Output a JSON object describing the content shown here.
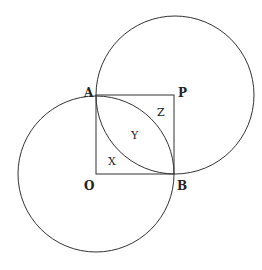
{
  "diagram": {
    "stroke_color": "#333333",
    "background": "#ffffff",
    "points": {
      "A": {
        "label": "A",
        "x": 96,
        "y": 95
      },
      "P": {
        "label": "P",
        "x": 174,
        "y": 95
      },
      "O": {
        "label": "O",
        "x": 96,
        "y": 174
      },
      "B": {
        "label": "B",
        "x": 174,
        "y": 174
      }
    },
    "circles": [
      {
        "center": "P",
        "radius": 79
      },
      {
        "center": "O",
        "radius": 78
      }
    ],
    "square": [
      "A",
      "P",
      "B",
      "O"
    ],
    "regions": {
      "X": "X",
      "Y": "Y",
      "Z": "Z"
    }
  }
}
